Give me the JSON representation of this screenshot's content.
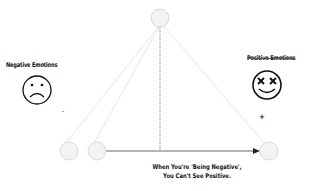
{
  "diagram": {
    "negative_label": "Negative Emotions",
    "negative_sign": "-",
    "positive_label": "Positive Emotions",
    "positive_sign": "+",
    "caption_line1": "When You're 'Being Negative',",
    "caption_line2": "You Can't See Positive.",
    "colors": {
      "node_fill": "#f2f2f2",
      "node_stroke": "#cfcfcf",
      "line_faint": "#dddddd",
      "arrow": "#333333",
      "text": "#111111"
    },
    "nodes": [
      {
        "id": "top",
        "cx": 160,
        "cy": 18,
        "r": 9
      },
      {
        "id": "bottom-left-1",
        "cx": 69,
        "cy": 151,
        "r": 9
      },
      {
        "id": "bottom-left-2",
        "cx": 97,
        "cy": 151,
        "r": 9
      },
      {
        "id": "bottom-right",
        "cx": 269,
        "cy": 151,
        "r": 9
      }
    ]
  }
}
